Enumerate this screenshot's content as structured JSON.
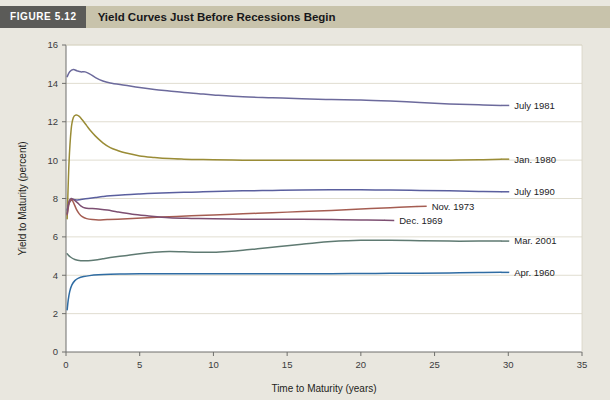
{
  "header": {
    "figure_number": "FIGURE 5.12",
    "title": "Yield Curves Just Before Recessions Begin",
    "number_block_color": "#5b5b58",
    "bar_color": "#c8c3ab"
  },
  "chart_data": {
    "type": "line",
    "title": "Yield Curves Just Before Recessions Begin",
    "xlabel": "Time to Maturity (years)",
    "ylabel": "Yield to Maturity (percent)",
    "xlim": [
      0,
      35
    ],
    "ylim": [
      0,
      16
    ],
    "xticks": [
      0,
      5,
      10,
      15,
      20,
      25,
      30,
      35
    ],
    "yticks": [
      0,
      2,
      4,
      6,
      8,
      10,
      12,
      14,
      16
    ],
    "grid": "horizontal",
    "legend": "inline-right-labels",
    "series": [
      {
        "name": "July 1981",
        "color": "#6c6a9c",
        "label_x": 30.2,
        "label_y": 12.85,
        "x": [
          0.08,
          0.25,
          0.5,
          0.75,
          1,
          1.3,
          1.6,
          2,
          2.5,
          3,
          4,
          5,
          6,
          7,
          8,
          9,
          10,
          12,
          14,
          16,
          18,
          20,
          22,
          24,
          26,
          28,
          29.5
        ],
        "y": [
          14.35,
          14.6,
          14.72,
          14.65,
          14.6,
          14.6,
          14.5,
          14.3,
          14.12,
          14.02,
          13.9,
          13.78,
          13.68,
          13.6,
          13.52,
          13.46,
          13.4,
          13.3,
          13.25,
          13.2,
          13.16,
          13.14,
          13.08,
          13.0,
          12.93,
          12.88,
          12.85
        ]
      },
      {
        "name": "Jan. 1980",
        "color": "#9a8c36",
        "label_x": 30.2,
        "label_y": 10.05,
        "x": [
          0.08,
          0.2,
          0.35,
          0.5,
          0.7,
          0.9,
          1.1,
          1.4,
          1.7,
          2,
          2.5,
          3,
          3.5,
          4,
          5,
          6,
          7,
          8,
          9,
          10,
          12,
          14,
          16,
          18,
          20,
          22,
          24,
          26,
          28,
          29.5
        ],
        "y": [
          6.95,
          9.8,
          11.6,
          12.22,
          12.35,
          12.28,
          12.1,
          11.8,
          11.5,
          11.25,
          10.9,
          10.65,
          10.5,
          10.38,
          10.22,
          10.14,
          10.08,
          10.05,
          10.03,
          10.02,
          10.0,
          10.0,
          10.0,
          10.0,
          10.0,
          10.0,
          10.0,
          10.0,
          10.02,
          10.05
        ]
      },
      {
        "name": "July 1990",
        "color": "#5a5f9e",
        "label_x": 30.2,
        "label_y": 8.35,
        "x": [
          0.08,
          0.2,
          0.35,
          0.5,
          0.75,
          1,
          1.5,
          2,
          2.5,
          3,
          4,
          5,
          6,
          7,
          8,
          9,
          10,
          12,
          14,
          16,
          18,
          20,
          22,
          24,
          26,
          28,
          29.5
        ],
        "y": [
          7.4,
          7.75,
          7.9,
          7.95,
          7.92,
          7.95,
          8.0,
          8.05,
          8.1,
          8.14,
          8.2,
          8.24,
          8.27,
          8.3,
          8.32,
          8.34,
          8.36,
          8.4,
          8.42,
          8.44,
          8.45,
          8.45,
          8.44,
          8.42,
          8.4,
          8.37,
          8.35
        ]
      },
      {
        "name": "Nov. 1973",
        "color": "#a55d52",
        "label_x": 24.6,
        "label_y": 7.6,
        "x": [
          0.08,
          0.2,
          0.35,
          0.5,
          0.7,
          0.9,
          1.1,
          1.4,
          1.8,
          2.2,
          2.8,
          3.5,
          4.5,
          5.5,
          7,
          8.5,
          10,
          12,
          14,
          16,
          18,
          20,
          22,
          23.8
        ],
        "y": [
          7.15,
          7.7,
          7.95,
          7.8,
          7.45,
          7.2,
          7.05,
          6.95,
          6.9,
          6.88,
          6.9,
          6.92,
          6.96,
          7.0,
          7.05,
          7.1,
          7.14,
          7.2,
          7.26,
          7.32,
          7.38,
          7.45,
          7.52,
          7.58
        ]
      },
      {
        "name": "Dec. 1969",
        "color": "#7d4f72",
        "label_x": 22.4,
        "label_y": 6.85,
        "x": [
          0.08,
          0.2,
          0.35,
          0.5,
          0.75,
          1,
          1.3,
          1.7,
          2.2,
          2.8,
          3.5,
          4.5,
          5.5,
          7,
          8.5,
          10,
          12,
          14,
          16,
          18,
          20,
          21.6
        ],
        "y": [
          7.2,
          7.85,
          8.0,
          7.95,
          7.8,
          7.62,
          7.5,
          7.48,
          7.45,
          7.4,
          7.3,
          7.18,
          7.1,
          7.0,
          6.96,
          6.94,
          6.92,
          6.92,
          6.92,
          6.9,
          6.88,
          6.86
        ]
      },
      {
        "name": "Mar. 2001",
        "color": "#5f7a72",
        "label_x": 30.2,
        "label_y": 5.78,
        "x": [
          0.08,
          0.3,
          0.6,
          1,
          1.5,
          2,
          2.5,
          3,
          4,
          5,
          6,
          7,
          8,
          9,
          10,
          11,
          12,
          13,
          14,
          15,
          16,
          17,
          18,
          19,
          20,
          22,
          24,
          26,
          28,
          29.5
        ],
        "y": [
          5.12,
          4.95,
          4.82,
          4.76,
          4.76,
          4.8,
          4.86,
          4.92,
          5.02,
          5.12,
          5.2,
          5.24,
          5.22,
          5.2,
          5.2,
          5.24,
          5.3,
          5.38,
          5.46,
          5.54,
          5.62,
          5.7,
          5.76,
          5.8,
          5.82,
          5.82,
          5.8,
          5.78,
          5.78,
          5.78
        ]
      },
      {
        "name": "Apr. 1960",
        "color": "#2f6ca3",
        "label_x": 30.2,
        "label_y": 4.15,
        "x": [
          0.08,
          0.15,
          0.25,
          0.4,
          0.6,
          0.85,
          1.2,
          1.6,
          2.2,
          3,
          4,
          5,
          6,
          8,
          10,
          12,
          14,
          16,
          18,
          20,
          22,
          24,
          26,
          28,
          29.5
        ],
        "y": [
          2.2,
          2.7,
          3.15,
          3.5,
          3.72,
          3.85,
          3.93,
          3.98,
          4.02,
          4.05,
          4.07,
          4.08,
          4.08,
          4.08,
          4.08,
          4.08,
          4.08,
          4.08,
          4.08,
          4.09,
          4.1,
          4.11,
          4.12,
          4.14,
          4.15
        ]
      }
    ]
  }
}
